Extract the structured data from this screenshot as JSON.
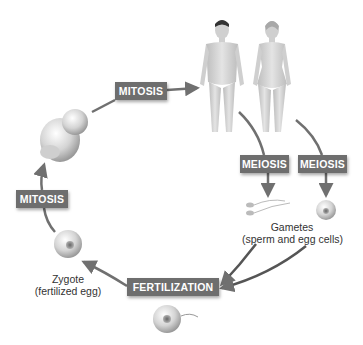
{
  "diagram": {
    "type": "life-cycle",
    "stages": [
      {
        "id": "adults",
        "depiction": "adult male and adult female figures"
      },
      {
        "id": "gametes",
        "label": "Gametes",
        "sublabel": "(sperm and egg cells)"
      },
      {
        "id": "zygote",
        "label": "Zygote",
        "sublabel": "(fertilized egg)"
      },
      {
        "id": "fetus",
        "depiction": "fetus"
      }
    ],
    "processes": {
      "mitosis_top": "MITOSIS",
      "meiosis_male": "MEIOSIS",
      "meiosis_female": "MEIOSIS",
      "fertilization": "FERTILIZATION",
      "mitosis_left": "MITOSIS"
    },
    "colors": {
      "label_bg": "#6e6e6e",
      "label_text": "#ffffff",
      "arrow": "#707070",
      "skin": "#d9d9d9"
    }
  }
}
